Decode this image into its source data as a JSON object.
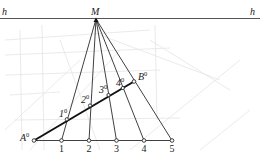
{
  "diagram": {
    "type": "perspective-division-construction",
    "colors": {
      "ink": "#2a2a2a",
      "background_sketch": "#e6e6e6",
      "paper": "#ffffff"
    },
    "horizon": {
      "label_left": "h",
      "label_right": "h",
      "y": 18.5,
      "x_start": 0,
      "x_end": 260
    },
    "vanishing_point": {
      "label": "M",
      "x": 96,
      "y": 19
    },
    "base_points": [
      {
        "label": "A",
        "sup": "0",
        "x": 34,
        "y": 140.5
      },
      {
        "label": "1",
        "x": 61.5,
        "y": 140.5
      },
      {
        "label": "2",
        "x": 89,
        "y": 140.5
      },
      {
        "label": "3",
        "x": 116.5,
        "y": 140.5
      },
      {
        "label": "4",
        "x": 144,
        "y": 140.5
      },
      {
        "label": "5",
        "x": 172,
        "y": 140.5
      }
    ],
    "segment_points": [
      {
        "label": "1",
        "sup": "0",
        "x": 66.8,
        "y": 119.3
      },
      {
        "label": "2",
        "sup": "0",
        "x": 90,
        "y": 105.5
      },
      {
        "label": "3",
        "sup": "0",
        "x": 108.5,
        "y": 95
      },
      {
        "label": "4",
        "sup": "0",
        "x": 122.8,
        "y": 88
      },
      {
        "label": "B",
        "sup": "0",
        "x": 134,
        "y": 81.5
      }
    ],
    "labels": {
      "M": "M",
      "h_left": "h",
      "h_right": "h",
      "A0_main": "A",
      "A0_sup": "0",
      "B0_main": "B",
      "B0_sup": "0",
      "p1_main": "1",
      "p1_sup": "0",
      "p2_main": "2",
      "p2_sup": "0",
      "p3_main": "3",
      "p3_sup": "0",
      "p4_main": "4",
      "p4_sup": "0",
      "n1": "1",
      "n2": "2",
      "n3": "3",
      "n4": "4",
      "n5": "5"
    }
  }
}
